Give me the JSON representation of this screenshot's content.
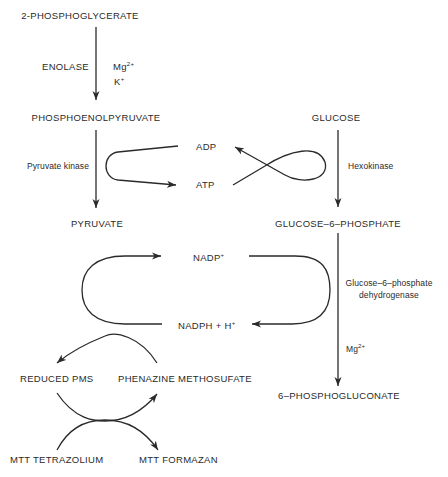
{
  "diagram": {
    "glycolysis_branch": {
      "substrate": "2-PHOSPHOGLYCERATE",
      "enzyme_1": "ENOLASE",
      "cofactor_1": "Mg",
      "cofactor_1_charge": "2+",
      "cofactor_2": "K",
      "cofactor_2_charge": "+",
      "intermediate": "PHOSPHOENOLPYRUVATE",
      "enzyme_2": "Pyruvate kinase",
      "product": "PYRUVATE"
    },
    "energy_coupling": {
      "adp": "ADP",
      "atp": "ATP"
    },
    "hexose_branch": {
      "substrate": "GLUCOSE",
      "enzyme_1": "Hexokinase",
      "intermediate": "GLUCOSE–6–PHOSPHATE",
      "enzyme_2_line1": "Glucose–6–phosphate",
      "enzyme_2_line2": "dehydrogenase",
      "cofactor": "Mg",
      "cofactor_charge": "2+",
      "product": "6–PHOSPHOGLUCONATE"
    },
    "nadp_cycle": {
      "oxidized": "NADP",
      "oxidized_charge": "+",
      "reduced": "NADPH + H",
      "reduced_charge": "+"
    },
    "pms_cycle": {
      "reduced": "REDUCED PMS",
      "oxidized": "PHENAZINE METHOSUFATE"
    },
    "mtt_cycle": {
      "substrate": "MTT TETRAZOLIUM",
      "product": "MTT FORMAZAN"
    }
  }
}
